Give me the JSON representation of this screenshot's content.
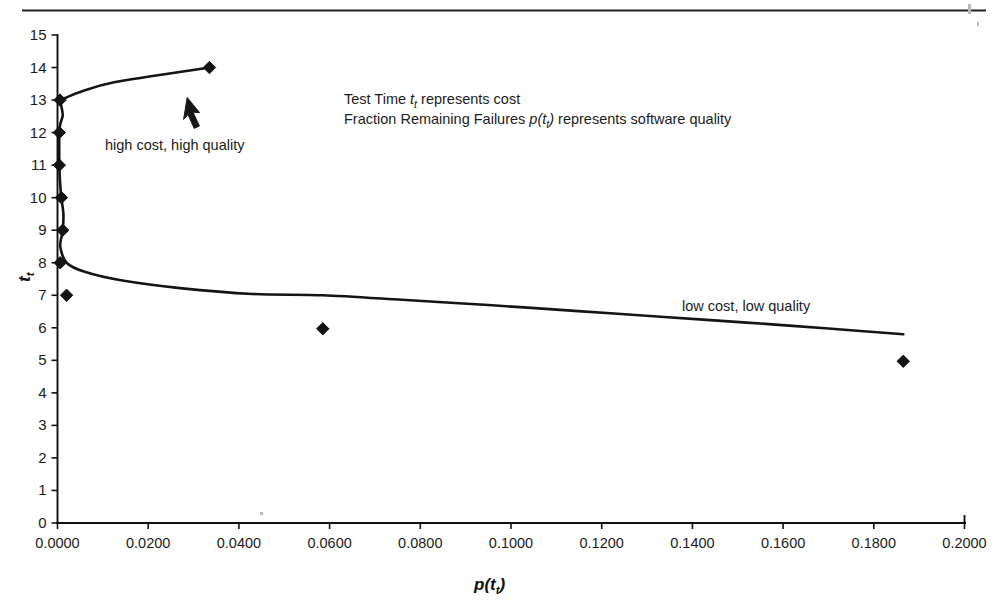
{
  "chart_data": {
    "type": "line",
    "title": "",
    "xlabel": "p(t_t)",
    "ylabel": "t_t",
    "xlim": [
      0.0,
      0.2
    ],
    "ylim": [
      0,
      15
    ],
    "grid": false,
    "legend": "none",
    "xticks": [
      "0.0000",
      "0.0200",
      "0.0400",
      "0.0600",
      "0.0800",
      "0.1000",
      "0.1200",
      "0.1400",
      "0.1600",
      "0.1800",
      "0.2000"
    ],
    "xtick_values": [
      0.0,
      0.02,
      0.04,
      0.06,
      0.08,
      0.1,
      0.12,
      0.14,
      0.16,
      0.18,
      0.2
    ],
    "yticks": [
      "0",
      "1",
      "2",
      "3",
      "4",
      "5",
      "6",
      "7",
      "8",
      "9",
      "10",
      "11",
      "12",
      "13",
      "14",
      "15"
    ],
    "ytick_values": [
      0,
      1,
      2,
      3,
      4,
      5,
      6,
      7,
      8,
      9,
      10,
      11,
      12,
      13,
      14,
      15
    ],
    "series": [
      {
        "name": "tradeoff-curve",
        "marker": "diamond",
        "x": [
          0.0335,
          0.0125,
          0.005,
          0.002,
          0.00055,
          0.0009,
          0.00115,
          0.0006,
          0.0004,
          0.00038,
          0.0004,
          0.00055,
          0.00085,
          0.0013,
          0.00115,
          0.0006,
          0.002,
          0.006,
          0.014,
          0.027,
          0.043,
          0.0585,
          0.076,
          0.095,
          0.114,
          0.133,
          0.152,
          0.17,
          0.1865
        ],
        "y": [
          14.0,
          13.55,
          13.25,
          13.08,
          13.0,
          12.78,
          12.52,
          12.26,
          12.0,
          11.5,
          11.0,
          10.5,
          10.0,
          9.5,
          9.0,
          8.5,
          8.0,
          7.72,
          7.46,
          7.22,
          7.04,
          7.0,
          6.86,
          6.7,
          6.52,
          6.34,
          6.16,
          5.98,
          5.8
        ],
        "markers": [
          {
            "x": 0.0335,
            "y": 14.0
          },
          {
            "x": 0.00055,
            "y": 13.0
          },
          {
            "x": 0.0004,
            "y": 12.0
          },
          {
            "x": 0.0004,
            "y": 11.0
          },
          {
            "x": 0.00085,
            "y": 10.0
          },
          {
            "x": 0.00115,
            "y": 9.0
          },
          {
            "x": 0.0006,
            "y": 8.0
          },
          {
            "x": 0.002,
            "y": 7.0
          },
          {
            "x": 0.0585,
            "y": 5.97
          },
          {
            "x": 0.1865,
            "y": 4.97
          }
        ]
      }
    ],
    "annotations": [
      {
        "name": "high-cost-high-quality",
        "text": "high cost, high quality",
        "x": 0.0105,
        "y": 11.86
      },
      {
        "name": "low-cost-low-quality",
        "text": "low cost, low quality",
        "x": 0.127,
        "y": 6.62
      },
      {
        "name": "arrow",
        "text": "",
        "x": 0.0215,
        "y": 12.72
      }
    ]
  },
  "notes": {
    "line1_prefix": "Test Time ",
    "line1_symbol": "t",
    "line1_symbol_sub": "t",
    "line1_suffix": " represents cost",
    "line2_prefix": "Fraction Remaining Failures ",
    "line2_symbol": "p(t",
    "line2_symbol_sub": "t",
    "line2_symbol_close": ")",
    "line2_suffix": " represents software quality"
  },
  "axis_titles": {
    "x_symbol": "p(t",
    "x_symbol_sub": "t",
    "x_symbol_close": ")",
    "y_symbol": "t",
    "y_symbol_sub": "t"
  },
  "callouts": {
    "high": "high cost, high quality",
    "low": "low cost, low quality"
  }
}
